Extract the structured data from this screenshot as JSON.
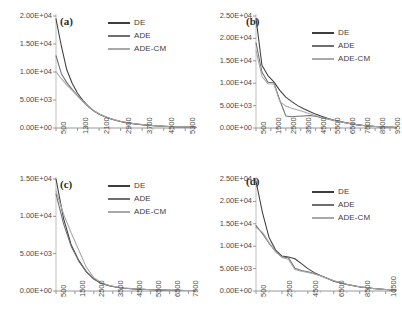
{
  "figure": {
    "panel_count": 4,
    "series_colors": {
      "DE": "#3d3d3d",
      "ADE": "#6e6e6e",
      "ADE-CM": "#a8a8a8"
    }
  },
  "legend": {
    "items": [
      {
        "label": "DE",
        "color": "#3d3d3d"
      },
      {
        "label": "ADE",
        "color": "#6e6e6e"
      },
      {
        "label": "ADE-CM",
        "color": "#a8a8a8"
      }
    ]
  },
  "panels": [
    {
      "tag": "(a)"
    },
    {
      "tag": "(b)"
    },
    {
      "tag": "(c)"
    },
    {
      "tag": "(d)"
    }
  ],
  "chart_data": [
    {
      "type": "line",
      "title": "(a)",
      "xlabel": "",
      "ylabel": "",
      "grid": false,
      "legend_position": "top-right",
      "xlim": [
        500,
        5700
      ],
      "ylim": [
        0,
        20000
      ],
      "yticks": [
        0,
        5000,
        10000,
        15000,
        20000
      ],
      "ytick_labels": [
        "0.00E+00",
        "5.00E+03",
        "1.00E+04",
        "1.50E+04",
        "2.00E+04"
      ],
      "xticks": [
        500,
        1300,
        2100,
        2900,
        3700,
        4500,
        5300
      ],
      "xtick_labels": [
        "500",
        "1300",
        "2100",
        "2900",
        "3700",
        "4500",
        "5300"
      ],
      "x": [
        500,
        700,
        900,
        1100,
        1300,
        1500,
        1700,
        1900,
        2100,
        2300,
        2500,
        2700,
        2900,
        3100,
        3300,
        3500,
        3700,
        3900,
        4100,
        4300,
        4500,
        4700,
        4900,
        5100,
        5300,
        5500,
        5700
      ],
      "series": [
        {
          "name": "DE",
          "color": "#3d3d3d",
          "values": [
            19500,
            14600,
            10400,
            8000,
            6200,
            4900,
            3900,
            3100,
            2500,
            2050,
            1700,
            1400,
            1150,
            950,
            800,
            680,
            570,
            480,
            410,
            350,
            300,
            255,
            215,
            185,
            160,
            135,
            120
          ]
        },
        {
          "name": "ADE",
          "color": "#6e6e6e",
          "values": [
            12900,
            9700,
            8100,
            6900,
            5800,
            4700,
            3800,
            3050,
            2500,
            2050,
            1700,
            1420,
            1180,
            990,
            840,
            710,
            600,
            510,
            430,
            370,
            315,
            268,
            228,
            195,
            168,
            143,
            125
          ]
        },
        {
          "name": "ADE-CM",
          "color": "#a8a8a8",
          "values": [
            10100,
            8800,
            7700,
            6700,
            5700,
            4700,
            3850,
            3100,
            2550,
            2100,
            1740,
            1450,
            1210,
            1010,
            860,
            730,
            620,
            525,
            445,
            380,
            325,
            276,
            235,
            200,
            172,
            147,
            128
          ]
        }
      ]
    },
    {
      "type": "line",
      "title": "(b)",
      "xlabel": "",
      "ylabel": "",
      "grid": false,
      "legend_position": "top-right",
      "xlim": [
        500,
        9900
      ],
      "ylim": [
        0,
        25000
      ],
      "yticks": [
        0,
        5000,
        10000,
        15000,
        20000,
        25000
      ],
      "ytick_labels": [
        "0.00E+00",
        "5.00E+03",
        "1.00E+04",
        "1.50E+04",
        "2.00E+04",
        "2.50E+04"
      ],
      "xticks": [
        500,
        1500,
        2500,
        3500,
        4500,
        5500,
        6500,
        7500,
        8500,
        9500
      ],
      "xtick_labels": [
        "500",
        "1500",
        "2500",
        "3500",
        "4500",
        "5500",
        "6500",
        "7500",
        "8500",
        "9500"
      ],
      "x": [
        500,
        900,
        1300,
        1700,
        2100,
        2500,
        2900,
        3300,
        3700,
        4100,
        4500,
        4900,
        5300,
        5700,
        6100,
        6500,
        6900,
        7300,
        7700,
        8100,
        8500,
        8900,
        9300,
        9700,
        9900
      ],
      "series": [
        {
          "name": "DE",
          "color": "#3d3d3d",
          "values": [
            24500,
            14000,
            11700,
            10300,
            8400,
            6900,
            5900,
            5000,
            4300,
            3700,
            3100,
            2600,
            2200,
            1800,
            1500,
            1200,
            950,
            750,
            580,
            450,
            340,
            260,
            200,
            150,
            130
          ]
        },
        {
          "name": "ADE",
          "color": "#6e6e6e",
          "values": [
            19000,
            12500,
            10200,
            10100,
            6200,
            2700,
            2500,
            2600,
            2700,
            2800,
            2600,
            2300,
            2000,
            1700,
            1400,
            1150,
            900,
            700,
            540,
            420,
            320,
            245,
            190,
            145,
            125
          ]
        },
        {
          "name": "ADE-CM",
          "color": "#a8a8a8",
          "values": [
            17300,
            11500,
            9900,
            9800,
            5900,
            4900,
            4400,
            4000,
            3600,
            3200,
            2800,
            2400,
            2050,
            1720,
            1430,
            1170,
            930,
            730,
            560,
            435,
            330,
            252,
            195,
            148,
            127
          ]
        }
      ]
    },
    {
      "type": "line",
      "title": "(c)",
      "xlabel": "",
      "ylabel": "",
      "grid": false,
      "legend_position": "top-right",
      "xlim": [
        500,
        7900
      ],
      "ylim": [
        0,
        15000
      ],
      "yticks": [
        0,
        5000,
        10000,
        15000
      ],
      "ytick_labels": [
        "0.00E+00",
        "5.00E+03",
        "1.00E+04",
        "1.50E+04"
      ],
      "xticks": [
        500,
        1500,
        2500,
        3500,
        4500,
        5500,
        6500,
        7500
      ],
      "xtick_labels": [
        "500",
        "1500",
        "2500",
        "3500",
        "4500",
        "5500",
        "6500",
        "7500"
      ],
      "x": [
        500,
        900,
        1300,
        1700,
        2100,
        2500,
        2900,
        3300,
        3700,
        4100,
        4500,
        4900,
        5300,
        5700,
        6100,
        6500,
        6900,
        7300,
        7700,
        7900
      ],
      "series": [
        {
          "name": "DE",
          "color": "#3d3d3d",
          "values": [
            16500,
            9700,
            6200,
            4100,
            2600,
            1600,
            1000,
            700,
            500,
            380,
            300,
            240,
            195,
            160,
            130,
            105,
            85,
            68,
            55,
            48
          ]
        },
        {
          "name": "ADE",
          "color": "#6e6e6e",
          "values": [
            13000,
            9000,
            6000,
            4000,
            2600,
            1650,
            1050,
            730,
            530,
            400,
            315,
            252,
            205,
            168,
            137,
            111,
            90,
            72,
            58,
            51
          ]
        },
        {
          "name": "ADE-CM",
          "color": "#a8a8a8",
          "values": [
            13400,
            10300,
            7800,
            5500,
            3200,
            1800,
            1100,
            760,
            550,
            415,
            327,
            262,
            213,
            175,
            143,
            116,
            94,
            75,
            61,
            53
          ]
        }
      ]
    },
    {
      "type": "line",
      "title": "(d)",
      "xlabel": "",
      "ylabel": "",
      "grid": false,
      "legend_position": "top-right",
      "xlim": [
        500,
        11300
      ],
      "ylim": [
        0,
        25000
      ],
      "yticks": [
        0,
        5000,
        10000,
        15000,
        20000,
        25000
      ],
      "ytick_labels": [
        "0.00E+00",
        "5.00E+03",
        "1.00E+04",
        "1.50E+04",
        "2.00E+04",
        "2.50E+04"
      ],
      "xticks": [
        500,
        2500,
        4500,
        6500,
        8500,
        10500
      ],
      "xtick_labels": [
        "500",
        "2500",
        "4500",
        "6500",
        "8500",
        "10500"
      ],
      "x": [
        500,
        1000,
        1500,
        2000,
        2500,
        3000,
        3500,
        4000,
        4500,
        5000,
        5500,
        6000,
        6500,
        7000,
        7500,
        8000,
        8500,
        9000,
        9500,
        10000,
        10500,
        11000,
        11300
      ],
      "series": [
        {
          "name": "DE",
          "color": "#3d3d3d",
          "values": [
            24500,
            17500,
            12000,
            9200,
            7800,
            7600,
            7200,
            6100,
            5000,
            4100,
            3400,
            2800,
            2200,
            1800,
            1450,
            1150,
            900,
            720,
            560,
            430,
            330,
            250,
            210
          ]
        },
        {
          "name": "ADE",
          "color": "#6e6e6e",
          "values": [
            14600,
            12800,
            10700,
            8900,
            7600,
            7400,
            5100,
            4600,
            4300,
            3900,
            3400,
            2850,
            2300,
            1880,
            1520,
            1210,
            950,
            760,
            590,
            455,
            350,
            265,
            222
          ]
        },
        {
          "name": "ADE-CM",
          "color": "#a8a8a8",
          "values": [
            14200,
            13100,
            10900,
            8800,
            7500,
            7100,
            4800,
            4400,
            4150,
            3800,
            3350,
            2800,
            2280,
            1860,
            1500,
            1195,
            940,
            750,
            585,
            450,
            346,
            262,
            220
          ]
        }
      ]
    }
  ]
}
